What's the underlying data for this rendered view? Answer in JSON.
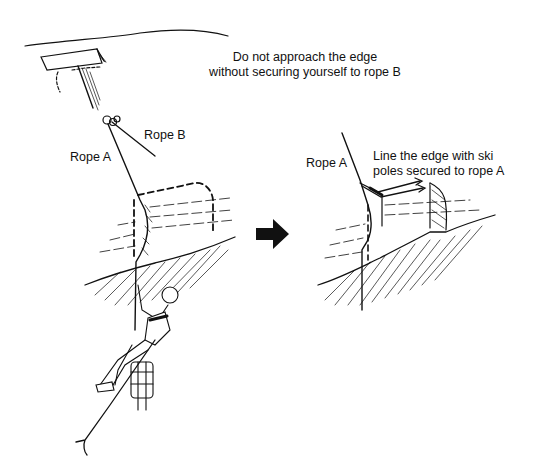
{
  "diagram": {
    "left_panel": {
      "caption_line1": "Do not approach the edge",
      "caption_line2": "without securing yourself to rope B",
      "labels": {
        "rope_a": "Rope A",
        "rope_b": "Rope B"
      }
    },
    "transition_arrow": "right-arrow",
    "right_panel": {
      "caption_line1": "Line the edge with ski",
      "caption_line2": "poles secured to rope A",
      "labels": {
        "rope_a": "Rope A"
      }
    },
    "colors": {
      "ink": "#111111",
      "background": "#ffffff"
    }
  }
}
